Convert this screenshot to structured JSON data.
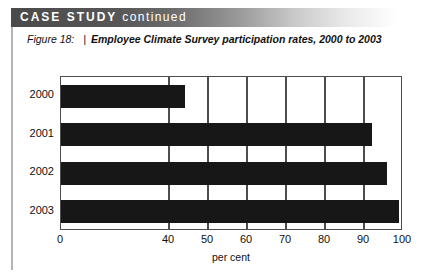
{
  "banner": {
    "strong_text": "CASE STUDY",
    "light_text": "continued",
    "background_from": "#4a4a4a",
    "background_to": "#ffffff",
    "text_color": "#ffffff"
  },
  "caption": {
    "figure_label": "Figure 18:",
    "separator": "|",
    "title": "Employee Climate Survey participation rates, 2000 to 2003"
  },
  "chart_data": {
    "type": "bar",
    "orientation": "horizontal",
    "title": "Employee Climate Survey participation rates, 2000 to 2003",
    "categories": [
      "2000",
      "2001",
      "2002",
      "2003"
    ],
    "values": [
      44,
      92,
      96,
      99
    ],
    "xlabel": "per cent",
    "ylabel": "",
    "xlim": [
      0,
      100
    ],
    "axis_break": true,
    "axis_break_note": "x-axis jumps from 0 directly to 40",
    "xticks": [
      0,
      40,
      50,
      60,
      70,
      80,
      90,
      100
    ],
    "xtick_labels": [
      "0",
      "40",
      "50",
      "60",
      "70",
      "80",
      "90",
      "100"
    ],
    "gridlines_at": [
      40,
      50,
      60,
      70,
      80,
      90,
      100
    ],
    "grid": true,
    "legend": false,
    "bar_color": "#171717",
    "frame_color": "#4d4d4d",
    "plot_background": "#ffffff"
  }
}
